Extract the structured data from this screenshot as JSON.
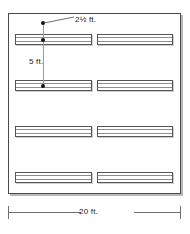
{
  "figure": {
    "type": "floor-plan-diagram"
  },
  "room": {
    "width_label": "20 ft.",
    "shape": "square",
    "border_color": "#4a4a4a",
    "fill_color": "#ffffff"
  },
  "annotations": {
    "bench_width": "2½ ft.",
    "row_spacing": "5 ft.",
    "overall_width": "20 ft."
  },
  "benches": [
    {
      "id": "bench-r1-c1",
      "row": 1,
      "column": 1
    },
    {
      "id": "bench-r1-c2",
      "row": 1,
      "column": 2
    },
    {
      "id": "bench-r2-c1",
      "row": 2,
      "column": 1
    },
    {
      "id": "bench-r2-c2",
      "row": 2,
      "column": 2
    },
    {
      "id": "bench-r3-c1",
      "row": 3,
      "column": 1
    },
    {
      "id": "bench-r3-c2",
      "row": 3,
      "column": 2
    },
    {
      "id": "bench-r4-c1",
      "row": 4,
      "column": 1
    },
    {
      "id": "bench-r4-c2",
      "row": 4,
      "column": 2
    }
  ],
  "layout": {
    "bench_geometry": [
      {
        "id": "bench-r1-c1",
        "left": 15,
        "top": 34
      },
      {
        "id": "bench-r1-c2",
        "left": 97,
        "top": 34
      },
      {
        "id": "bench-r2-c1",
        "left": 15,
        "top": 80
      },
      {
        "id": "bench-r2-c2",
        "left": 97,
        "top": 80
      },
      {
        "id": "bench-r3-c1",
        "left": 15,
        "top": 126
      },
      {
        "id": "bench-r3-c2",
        "left": 97,
        "top": 126
      },
      {
        "id": "bench-r4-c1",
        "left": 15,
        "top": 172
      },
      {
        "id": "bench-r4-c2",
        "left": 97,
        "top": 172
      }
    ],
    "bench_width_left_col": 77,
    "bench_width_right_col": 76
  },
  "colors": {
    "line": "#555555",
    "text": "#1b1b1b",
    "shadow": "#c9c9c9",
    "slat": "#8d8d8d"
  }
}
